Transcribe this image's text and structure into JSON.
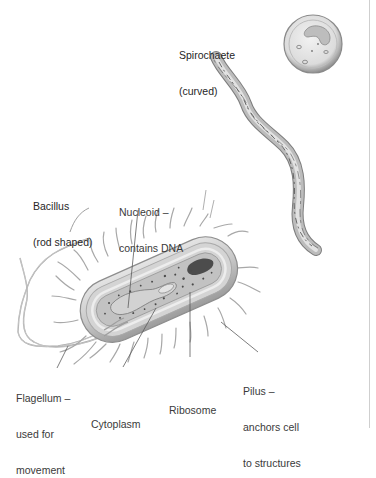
{
  "figure": {
    "subjects": [
      {
        "id": "coccus",
        "name": "Coccus (spherical)",
        "label_shown": false
      },
      {
        "id": "spirochaete",
        "name": "Spirochaete",
        "label_line1": "Spirochaete",
        "label_line2": "(curved)"
      },
      {
        "id": "bacillus",
        "name": "Bacillus",
        "label_line1": "Bacillus",
        "label_line2": "(rod shaped)"
      }
    ],
    "labels": {
      "spirochaete": {
        "line1": "Spirochaete",
        "line2": "(curved)"
      },
      "bacillus": {
        "line1": "Bacillus",
        "line2": "(rod shaped)"
      },
      "nucleoid": {
        "line1": "Nucleoid –",
        "line2": "contains DNA"
      },
      "flagellum": {
        "line1": "Flagellum –",
        "line2": "used for",
        "line3": "movement"
      },
      "cytoplasm": {
        "line1": "Cytoplasm"
      },
      "ribosome": {
        "line1": "Ribosome"
      },
      "pilus": {
        "line1": "Pilus –",
        "line2": "anchors cell",
        "line3": "to structures"
      }
    },
    "colors": {
      "background": "#ffffff",
      "label_text": "#3a3a3a",
      "leader_line": "#555555",
      "cell_wall": "#b9b9b9",
      "cell_inner": "#d6d6d6",
      "cytoplasm": "#c4c4c4",
      "nucleoid_dark": "#4a4a4a",
      "pili": "#9a9a9a"
    }
  }
}
